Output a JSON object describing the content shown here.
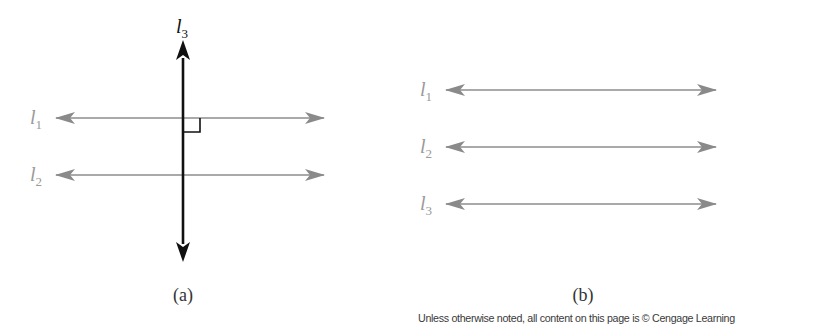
{
  "figure_a": {
    "caption": "(a)",
    "horizontal_lines": [
      {
        "name": "l",
        "subscript": "1",
        "y": 118
      },
      {
        "name": "l",
        "subscript": "2",
        "y": 175
      }
    ],
    "vertical_line": {
      "name": "l",
      "subscript": "3",
      "x": 183,
      "y_top": 40,
      "y_bottom": 262
    },
    "right_angle_marker": true,
    "colors": {
      "horizontal": "#8c8c8c",
      "vertical": "#111111",
      "label_gray": "#999999"
    }
  },
  "figure_b": {
    "caption": "(b)",
    "horizontal_lines": [
      {
        "name": "l",
        "subscript": "1",
        "y": 90
      },
      {
        "name": "l",
        "subscript": "2",
        "y": 147
      },
      {
        "name": "l",
        "subscript": "3",
        "y": 204
      }
    ],
    "colors": {
      "horizontal": "#8c8c8c",
      "label_gray": "#999999"
    }
  },
  "labels": {
    "a_l1_main": "l",
    "a_l1_sub": "1",
    "a_l2_main": "l",
    "a_l2_sub": "2",
    "a_l3_main": "l",
    "a_l3_sub": "3",
    "b_l1_main": "l",
    "b_l1_sub": "1",
    "b_l2_main": "l",
    "b_l2_sub": "2",
    "b_l3_main": "l",
    "b_l3_sub": "3"
  },
  "footer": {
    "copyright": "Unless otherwise noted, all content on this page is © Cengage Learning"
  }
}
